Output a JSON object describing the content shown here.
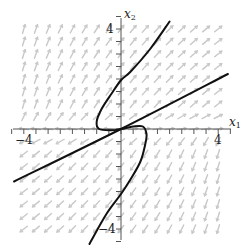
{
  "chart_data": {
    "type": "line",
    "title": "",
    "subtitle": "Phase portrait with direction field",
    "xlabel": "x1",
    "ylabel": "x2",
    "xlim": [
      -4.5,
      4.5
    ],
    "ylim": [
      -4.5,
      4.5
    ],
    "x_ticks": {
      "major_labels": [
        -4,
        4
      ],
      "minor_step": 0.5
    },
    "y_ticks": {
      "major_labels": [
        4,
        -4
      ],
      "minor_step": 0.5
    },
    "grid": false,
    "legend": null,
    "series": [
      {
        "name": "straight-line trajectory",
        "points": [
          [
            -4.4,
            -2.1
          ],
          [
            0,
            0
          ],
          [
            4.4,
            2.2
          ]
        ]
      },
      {
        "name": "S-shaped trajectory",
        "points": [
          [
            2.0,
            4.3
          ],
          [
            1.2,
            3.2
          ],
          [
            0.4,
            2.3
          ],
          [
            0.0,
            1.95
          ],
          [
            -0.4,
            1.4
          ],
          [
            -0.8,
            0.8
          ],
          [
            -1.0,
            0.3
          ],
          [
            -0.9,
            0.0
          ],
          [
            -0.4,
            -0.05
          ],
          [
            0.0,
            0.0
          ],
          [
            0.5,
            0.1
          ],
          [
            0.9,
            0.1
          ],
          [
            1.05,
            -0.2
          ],
          [
            1.0,
            -0.6
          ],
          [
            0.8,
            -1.3
          ],
          [
            0.4,
            -2.0
          ],
          [
            0.0,
            -2.6
          ],
          [
            -0.6,
            -3.4
          ],
          [
            -1.3,
            -4.6
          ]
        ]
      }
    ],
    "direction_field": {
      "color": "#c8c8c8",
      "spacing": 0.5,
      "pattern": "upper half arrows point up/up-right (NE), right of origin near axis point right; lower half arrows point down/down-left (SW), left of origin near axis point left"
    }
  },
  "labels": {
    "x_axis_name": "x",
    "x_axis_sub": "1",
    "y_axis_name": "x",
    "y_axis_sub": "2",
    "x_tick_neg": "−4",
    "x_tick_pos": "4",
    "y_tick_pos": "4",
    "y_tick_neg": "−4"
  },
  "colors": {
    "axis": "#555555",
    "curve": "#111111",
    "field": "#c8c8c8"
  }
}
